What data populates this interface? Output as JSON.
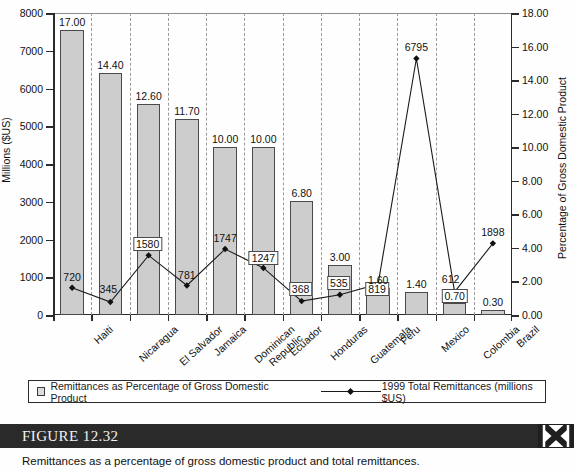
{
  "figure": {
    "label_word": "FIGURE",
    "number": "12.32",
    "caption": "Remittances as a percentage of gross domestic product and total remittances.",
    "close_icon": "x-icon"
  },
  "legend": {
    "bars_label": "Remittances as Percentage of Gross Domestic Product",
    "line_label": "1999 Total Remittances (millions $US)",
    "bars_swatch_color": "#dcdcdc",
    "line_color": "#1a1a1a"
  },
  "chart_data": {
    "type": "bar",
    "title": "",
    "xlabel": "",
    "ylabel": "Millions ($US)",
    "y2label": "Percentage of Gross Domestic Product",
    "ylim": [
      0,
      8000
    ],
    "y2lim": [
      0,
      18
    ],
    "yticks": [
      "0",
      "1000",
      "2000",
      "3000",
      "4000",
      "5000",
      "6000",
      "7000",
      "8000"
    ],
    "y2ticks": [
      "0.00",
      "2.00",
      "4.00",
      "6.00",
      "8.00",
      "10.00",
      "12.00",
      "14.00",
      "16.00",
      "18.00"
    ],
    "grid": "vertical-dashed",
    "legend_position": "below-plot",
    "categories": [
      "Haiti",
      "Nicaragua",
      "El Salvador",
      "Jamaica",
      "Dominican Republic",
      "Ecuador",
      "Honduras",
      "Guatemala",
      "Peru",
      "Mexico",
      "Colombia",
      "Brazil"
    ],
    "category_lines": [
      [
        "Haiti"
      ],
      [
        "Nicaragua"
      ],
      [
        "El Salvador"
      ],
      [
        "Jamaica"
      ],
      [
        "Dominican",
        "Republic"
      ],
      [
        "Ecuador"
      ],
      [
        "Honduras"
      ],
      [
        "Guatemala"
      ],
      [
        "Peru"
      ],
      [
        "Mexico"
      ],
      [
        "Colombia"
      ],
      [
        "Brazil"
      ]
    ],
    "series": [
      {
        "name": "Remittances as Percentage of Gross Domestic Product",
        "render": "bar",
        "axis": "right",
        "values": [
          17.0,
          14.4,
          12.6,
          11.7,
          10.0,
          10.0,
          6.8,
          3.0,
          1.6,
          1.4,
          0.7,
          0.3
        ],
        "labels": [
          "17.00",
          "14.40",
          "12.60",
          "11.70",
          "10.00",
          "10.00",
          "6.80",
          "3.00",
          "1.60",
          "1.40",
          "0.70",
          "0.30"
        ],
        "label_boxed": [
          false,
          false,
          false,
          false,
          false,
          false,
          false,
          false,
          false,
          false,
          true,
          false
        ]
      },
      {
        "name": "1999 Total Remittances (millions $US)",
        "render": "line",
        "axis": "left",
        "values": [
          720,
          345,
          1580,
          781,
          1747,
          1247,
          368,
          535,
          819,
          6795,
          612,
          1898
        ],
        "labels": [
          "720",
          "345",
          "1580",
          "781",
          "1747",
          "1247",
          "368",
          "535",
          "819",
          "6795",
          "612",
          "1898"
        ],
        "label_boxed": [
          false,
          false,
          true,
          false,
          false,
          true,
          true,
          true,
          true,
          false,
          false,
          false
        ]
      }
    ]
  }
}
